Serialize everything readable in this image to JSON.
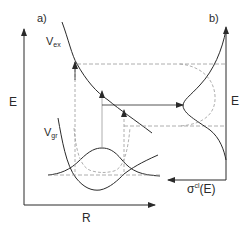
{
  "figure": {
    "panel_a": {
      "label": "a)",
      "y_axis_label": "E",
      "x_axis_label": "R",
      "curves": {
        "excited_potential": {
          "label_main": "V",
          "label_sub": "ex"
        },
        "ground_potential": {
          "label_main": "V",
          "label_sub": "gr"
        }
      }
    },
    "panel_b": {
      "label": "b)",
      "y_axis_label": "E",
      "x_axis_label_main": "σ",
      "x_axis_label_sup": "cl",
      "x_axis_label_tail": "(E)"
    },
    "colors": {
      "line": "#2a2a2a",
      "dashed": "#9a9a9a",
      "background": "#ffffff"
    }
  }
}
